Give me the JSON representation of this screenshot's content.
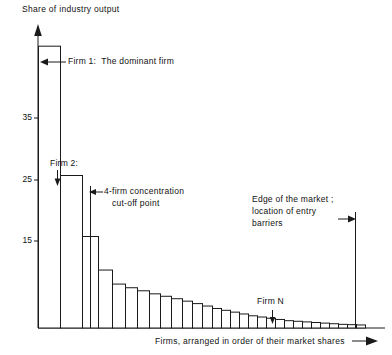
{
  "figure": {
    "y_axis_title": "Share of industry output",
    "x_axis_title": "Firms, arranged in order of their market shares",
    "y_ticks": [
      "35",
      "25",
      "15"
    ],
    "annotations": {
      "firm1": "Firm 1:  The dominant firm",
      "firm2": "Firm 2:",
      "cutoff_line1": "4-firm concentration",
      "cutoff_line2": "cut-off point",
      "edge_line1": "Edge of the market ;",
      "edge_line2": "location of entry",
      "edge_line3": "barriers",
      "firmN": "Firm N"
    },
    "colors": {
      "ink": "#1a1a1a",
      "paper": "#ffffff"
    }
  },
  "chart_data": {
    "type": "bar",
    "title": "",
    "subtitle": "",
    "xlabel": "Firms, arranged in order of their market shares",
    "ylabel": "Share of industry output",
    "ylim": [
      0,
      48
    ],
    "yticks": [
      15,
      25,
      35
    ],
    "grid": false,
    "legend": null,
    "categories": [
      "Firm 1",
      "Firm 2",
      "Firm 3",
      "Firm 4",
      "Firm 5",
      "Firm 6",
      "Firm 7",
      "Firm 8",
      "Firm 9",
      "Firm 10",
      "Firm 11",
      "Firm 12",
      "Firm 13",
      "Firm 14",
      "Firm 15",
      "Firm 16",
      "Firm 17",
      "Firm 18",
      "Firm 19",
      "Firm 20",
      "Firm 21",
      "Firm 22",
      "Firm 23",
      "Firm 24",
      "Firm 25",
      "Firm 26",
      "Firm 27",
      "Firm 28",
      "Firm 29",
      "Firm 30"
    ],
    "values": [
      46.2,
      25.0,
      15.0,
      9.5,
      7.2,
      6.6,
      6.1,
      5.6,
      5.2,
      4.8,
      4.4,
      4.0,
      3.6,
      3.2,
      2.9,
      2.6,
      2.3,
      2.0,
      1.8,
      1.6,
      1.4,
      1.2,
      1.1,
      1.0,
      0.9,
      0.8,
      0.7,
      0.6,
      0.55,
      0.5
    ],
    "bar_widths_px": [
      22,
      22,
      16,
      14,
      13,
      12,
      12,
      11,
      11,
      11,
      10,
      10,
      10,
      9,
      9,
      9,
      9,
      9,
      9,
      9,
      9,
      9,
      9,
      9,
      9,
      9,
      9,
      9,
      9,
      9
    ],
    "annotations": [
      {
        "label": "Firm 1:  The dominant firm",
        "target": "Firm 1",
        "kind": "arrow-left"
      },
      {
        "label": "Firm 2:",
        "target": "Firm 2",
        "kind": "arrow-down"
      },
      {
        "label": "4-firm concentration cut-off point",
        "target": "after Firm 4",
        "kind": "vertical-line"
      },
      {
        "label": "Edge of the market ; location of entry barriers",
        "target": "right edge",
        "kind": "vertical-line"
      },
      {
        "label": "Firm N",
        "target": "tail bar",
        "kind": "arrow-down"
      }
    ]
  }
}
